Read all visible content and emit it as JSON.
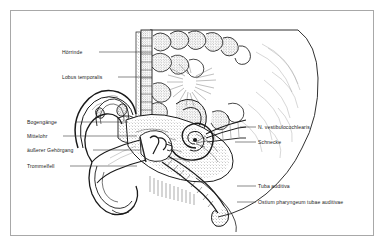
{
  "figure": {
    "style": "black-and-white line drawing, sagittal section through the temporal bone and ear",
    "frame_color": "#a8a8a8",
    "ink_color": "#1a1a1a",
    "background_color": "#ffffff"
  },
  "labels": {
    "left": [
      {
        "id": "hoerrinde",
        "text": "Hörrinde",
        "meaning": "auditory cortex",
        "x": 62,
        "y": 49,
        "leader": {
          "x1": 99,
          "x2": 152,
          "y": 52
        }
      },
      {
        "id": "lobus-temporalis",
        "text": "Lobus temporalis",
        "meaning": "temporal lobe",
        "x": 62,
        "y": 74,
        "leader": {
          "x1": 118,
          "x2": 152,
          "y": 77
        }
      },
      {
        "id": "bogengaenge",
        "text": "Bogengänge",
        "meaning": "semicircular canals",
        "x": 27,
        "y": 119,
        "leader": {
          "x1": 75,
          "x2": 128,
          "y": 122
        }
      },
      {
        "id": "mittelohr",
        "text": "Mittelohr",
        "meaning": "middle ear",
        "x": 27,
        "y": 133,
        "leader": {
          "x1": 63,
          "x2": 137,
          "y": 136
        }
      },
      {
        "id": "aeusserer-gehoergang",
        "text": "äußerer Gehörgang",
        "meaning": "external auditory canal",
        "x": 27,
        "y": 147,
        "leader": {
          "x1": 93,
          "x2": 140,
          "y": 150
        }
      },
      {
        "id": "trommelfell",
        "text": "Trommelfell",
        "meaning": "eardrum / tympanic membrane",
        "x": 27,
        "y": 163,
        "leader": {
          "x1": 70,
          "x2": 137,
          "y": 166
        }
      }
    ],
    "right": [
      {
        "id": "n-vestibulocochlearis",
        "text": "N. vestibulocochlearis",
        "meaning": "vestibulocochlear nerve",
        "x": 258,
        "y": 124,
        "leader": {
          "x1": 240,
          "x2": 256,
          "y": 127
        }
      },
      {
        "id": "schnecke",
        "text": "Schnecke",
        "meaning": "cochlea",
        "x": 258,
        "y": 139,
        "leader": {
          "x1": 235,
          "x2": 256,
          "y": 142
        }
      },
      {
        "id": "tuba-auditiva",
        "text": "Tuba auditiva",
        "meaning": "auditory tube / Eustachian tube",
        "x": 258,
        "y": 183,
        "leader": {
          "x1": 237,
          "x2": 256,
          "y": 186
        }
      },
      {
        "id": "ostium-pharyngeum",
        "text": "Ostium pharyngeum tubae auditivae",
        "meaning": "pharyngeal opening of the auditory tube",
        "x": 258,
        "y": 199,
        "leader": {
          "x1": 237,
          "x2": 256,
          "y": 202
        }
      }
    ]
  }
}
